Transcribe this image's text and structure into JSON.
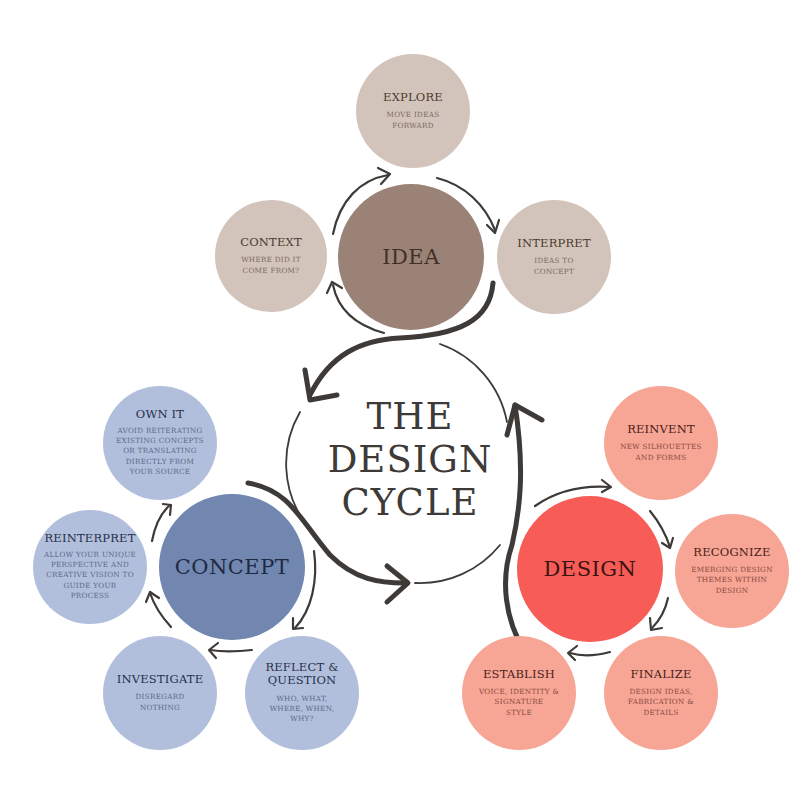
{
  "title": [
    "THE",
    "DESIGN",
    "CYCLE"
  ],
  "colors": {
    "arrow": "#3e3a37",
    "idea_hub": "#9a8376",
    "idea_node": "#d2c4ba",
    "idea_text": "#4a3a30",
    "idea_desc": "#7a6a60",
    "concept_hub": "#7187b0",
    "concept_node": "#b2bfdc",
    "concept_text": "#26304a",
    "concept_desc": "#5d6888",
    "design_hub": "#f75c57",
    "design_node": "#f7a595",
    "design_text": "#4a1e1a",
    "design_desc": "#8a4a40"
  },
  "phases": {
    "idea": {
      "label": "IDEA",
      "steps": [
        {
          "title": "EXPLORE",
          "desc": [
            "MOVE IDEAS",
            "FORWARD"
          ]
        },
        {
          "title": "INTERPRET",
          "desc": [
            "IDEAS TO",
            "CONCEPT"
          ]
        },
        {
          "title": "CONTEXT",
          "desc": [
            "WHERE DID IT",
            "COME FROM?"
          ]
        }
      ]
    },
    "concept": {
      "label": "CONCEPT",
      "steps": [
        {
          "title": "OWN IT",
          "desc": [
            "AVOID REITERATING",
            "EXISTING CONCEPTS",
            "OR TRANSLATING",
            "DIRECTLY FROM",
            "YOUR SOURCE"
          ]
        },
        {
          "title": "REINTERPRET",
          "desc": [
            "ALLOW YOUR UNIQUE",
            "PERSPECTIVE AND",
            "CREATIVE VISION TO",
            "GUIDE YOUR",
            "PROCESS"
          ]
        },
        {
          "title": "INVESTIGATE",
          "desc": [
            "DISREGARD",
            "NOTHING"
          ]
        },
        {
          "title": "REFLECT &",
          "title2": "QUESTION",
          "desc": [
            "WHO, WHAT,",
            "WHERE, WHEN,",
            "WHY?"
          ]
        }
      ]
    },
    "design": {
      "label": "DESIGN",
      "steps": [
        {
          "title": "REINVENT",
          "desc": [
            "NEW SILHOUETTES",
            "AND FORMS"
          ]
        },
        {
          "title": "RECOGNIZE",
          "desc": [
            "EMERGING DESIGN",
            "THEMES WITHIN",
            "DESIGN"
          ]
        },
        {
          "title": "FINALIZE",
          "desc": [
            "DESIGN IDEAS,",
            "FABRICATION &",
            "DETAILS"
          ]
        },
        {
          "title": "ESTABLISH",
          "desc": [
            "VOICE, IDENTITY &",
            "SIGNATURE",
            "STYLE"
          ]
        }
      ]
    }
  }
}
